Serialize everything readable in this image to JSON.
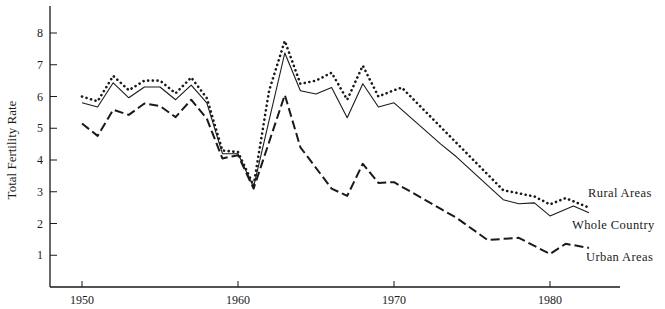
{
  "chart_data": {
    "type": "line",
    "title": "",
    "xlabel": "",
    "ylabel": "Total Fertility Rate",
    "xlim": [
      1948.9,
      1984.5
    ],
    "ylim": [
      0,
      8.9
    ],
    "grid": false,
    "legend_position": "inline-right",
    "x_ticks": [
      1950,
      1960,
      1970,
      1980
    ],
    "y_ticks": [
      1,
      2,
      3,
      4,
      5,
      6,
      7,
      8
    ],
    "series": [
      {
        "name": "Rural Areas",
        "style": "dotted",
        "x": [
          1950,
          1951,
          1952,
          1953,
          1954,
          1955,
          1956,
          1957,
          1958,
          1959,
          1960,
          1961,
          1962,
          1963,
          1964,
          1965,
          1966,
          1967,
          1968,
          1969,
          1970,
          1970.5,
          1977,
          1978,
          1979,
          1980,
          1981,
          1982.5
        ],
        "values": [
          6.0,
          5.85,
          6.65,
          6.2,
          6.5,
          6.5,
          6.1,
          6.6,
          5.95,
          4.3,
          4.25,
          3.2,
          6.2,
          7.75,
          6.4,
          6.5,
          6.75,
          5.9,
          6.97,
          6.0,
          6.2,
          6.28,
          3.05,
          2.95,
          2.85,
          2.6,
          2.8,
          2.5
        ]
      },
      {
        "name": "Whole Country",
        "style": "solid",
        "x": [
          1950,
          1951,
          1952,
          1953,
          1954,
          1955,
          1956,
          1957,
          1958,
          1959,
          1960,
          1961,
          1963,
          1964,
          1965,
          1966,
          1967,
          1968,
          1969,
          1970,
          1973,
          1974,
          1977,
          1978,
          1979,
          1980,
          1981.5,
          1982.5
        ],
        "values": [
          5.8,
          5.67,
          6.43,
          5.96,
          6.3,
          6.3,
          5.9,
          6.36,
          5.8,
          4.2,
          4.2,
          3.15,
          7.37,
          6.18,
          6.08,
          6.28,
          5.33,
          6.4,
          5.67,
          5.8,
          4.5,
          4.1,
          2.75,
          2.62,
          2.65,
          2.24,
          2.55,
          2.34
        ]
      },
      {
        "name": "Urban Areas",
        "style": "dashed",
        "x": [
          1950,
          1951,
          1952,
          1953,
          1954,
          1955,
          1956,
          1957,
          1958,
          1959,
          1960,
          1961,
          1963,
          1964,
          1966,
          1967,
          1968,
          1969,
          1970,
          1973,
          1974,
          1976,
          1978,
          1980,
          1981,
          1982.5
        ],
        "values": [
          5.15,
          4.76,
          5.58,
          5.42,
          5.78,
          5.7,
          5.35,
          5.9,
          5.3,
          4.05,
          4.15,
          3.1,
          6.05,
          4.4,
          3.1,
          2.87,
          3.88,
          3.28,
          3.3,
          2.46,
          2.18,
          1.48,
          1.55,
          1.04,
          1.36,
          1.23
        ]
      }
    ]
  },
  "labels": {
    "y_axis_title": "Total Fertility Rate",
    "series": [
      "Rural Areas",
      "Whole Country",
      "Urban Areas"
    ]
  },
  "colors": {
    "ink": "#1a1a1a",
    "background": "#ffffff"
  }
}
